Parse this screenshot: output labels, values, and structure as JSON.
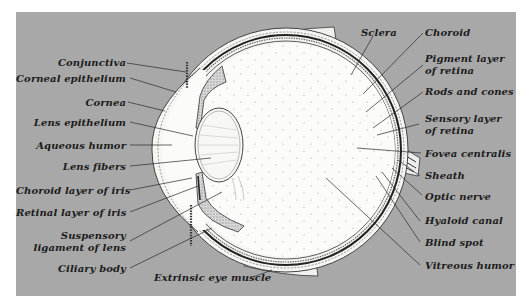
{
  "diagram": {
    "background_color": "#a8a8a8",
    "left_labels": [
      {
        "text": "Conjunctiva"
      },
      {
        "text": "Corneal epithelium"
      },
      {
        "text": "Cornea"
      },
      {
        "text": "Lens epithelium"
      },
      {
        "text": "Aqueous humor"
      },
      {
        "text": "Lens fibers"
      },
      {
        "text": "Choroid layer of iris"
      },
      {
        "text": "Retinal layer of iris"
      },
      {
        "text": "Suspensory",
        "text2": "ligament of lens"
      },
      {
        "text": "Ciliary body"
      }
    ],
    "right_labels": [
      {
        "text": "Sclera"
      },
      {
        "text": "Choroid"
      },
      {
        "text": "Pigment layer",
        "text2": "of retina"
      },
      {
        "text": "Rods and cones"
      },
      {
        "text": "Sensory layer",
        "text2": "of retina"
      },
      {
        "text": "Fovea centralis"
      },
      {
        "text": "Sheath"
      },
      {
        "text": "Optic nerve"
      },
      {
        "text": "Hyaloid canal"
      },
      {
        "text": "Blind spot"
      },
      {
        "text": "Vitreous humor"
      }
    ],
    "bottom_labels": [
      {
        "text": "Extrinsic eye muscle"
      }
    ]
  }
}
